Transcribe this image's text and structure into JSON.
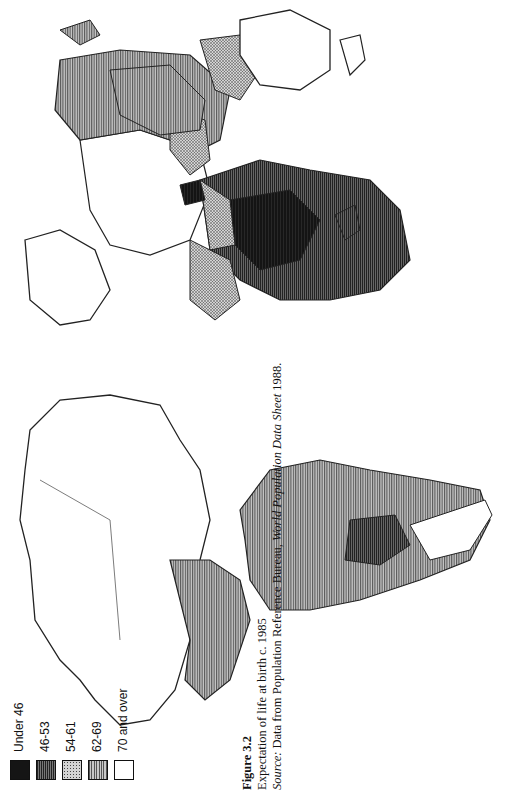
{
  "figure": {
    "label": "Figure 3.2",
    "title": "Expectation of life at birth c. 1985",
    "source_label": "Source:",
    "source_text_1": " Data from Population Reference Bureau, ",
    "source_title": "World Population Data Sheet",
    "source_text_2": " 1988."
  },
  "legend": {
    "items": [
      {
        "label": "Under 46",
        "fill": "#1a1a1a",
        "pattern": "solid-dark"
      },
      {
        "label": "46-53",
        "fill": "#4a4a4a",
        "pattern": "dense-vertical-lines"
      },
      {
        "label": "54-61",
        "fill": "#9a9a9a",
        "pattern": "stipple"
      },
      {
        "label": "62-69",
        "fill": "#8c8c8c",
        "pattern": "vertical-lines"
      },
      {
        "label": "70 and over",
        "fill": "#ffffff",
        "pattern": "blank"
      }
    ]
  },
  "map": {
    "orientation": "rotated 90° counter-clockwise",
    "regions": [
      {
        "name": "North America (Canada/USA)",
        "class": "70 and over"
      },
      {
        "name": "Mexico/Central America",
        "class": "62-69"
      },
      {
        "name": "South America (most)",
        "class": "62-69"
      },
      {
        "name": "Bolivia region",
        "class": "46-53"
      },
      {
        "name": "Southern Cone",
        "class": "70 and over"
      },
      {
        "name": "Western Europe",
        "class": "70 and over"
      },
      {
        "name": "USSR",
        "class": "62-69"
      },
      {
        "name": "North Africa",
        "class": "54-61"
      },
      {
        "name": "Sub-Saharan Africa",
        "class": "Under 46 / 46-53"
      },
      {
        "name": "Madagascar",
        "class": "46-53"
      },
      {
        "name": "Middle East",
        "class": "54-61"
      },
      {
        "name": "Afghanistan",
        "class": "Under 46"
      },
      {
        "name": "South Asia",
        "class": "54-61"
      },
      {
        "name": "China",
        "class": "62-69"
      },
      {
        "name": "Southeast Asia",
        "class": "54-61"
      },
      {
        "name": "Japan",
        "class": "70 and over"
      },
      {
        "name": "Australia",
        "class": "70 and over"
      },
      {
        "name": "Greenland",
        "class": "70 and over"
      }
    ]
  }
}
